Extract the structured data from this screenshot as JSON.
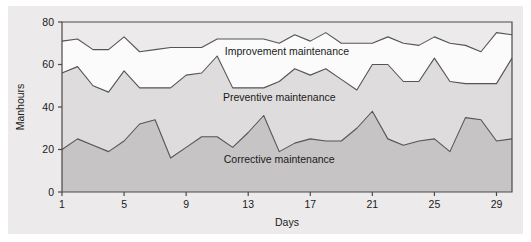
{
  "chart_data": {
    "type": "area",
    "stacked": true,
    "title": "",
    "xlabel": "Days",
    "ylabel": "Manhours",
    "xlim": [
      1,
      30
    ],
    "ylim": [
      0,
      80
    ],
    "xticks": [
      1,
      5,
      9,
      13,
      17,
      21,
      25,
      29
    ],
    "xtick_labels": [
      "1",
      "5",
      "9",
      "13",
      "17",
      "21",
      "25",
      "29"
    ],
    "yticks": [
      0,
      20,
      40,
      60,
      80
    ],
    "ytick_labels": [
      "0",
      "20",
      "40",
      "60",
      "80"
    ],
    "grid": false,
    "legend_position": "inline-annotations",
    "x": [
      1,
      2,
      3,
      4,
      5,
      6,
      7,
      8,
      9,
      10,
      11,
      12,
      13,
      14,
      15,
      16,
      17,
      18,
      19,
      20,
      21,
      22,
      23,
      24,
      25,
      26,
      27,
      28,
      29,
      30
    ],
    "series": [
      {
        "name": "Corrective maintenance",
        "label": "Corrective maintenance",
        "fill_color": "#c6c4c4",
        "line_color": "#555555",
        "values": [
          20,
          25,
          22,
          19,
          24,
          32,
          34,
          16,
          21,
          26,
          26,
          21,
          28,
          36,
          19,
          23,
          25,
          24,
          24,
          30,
          38,
          25,
          22,
          24,
          25,
          19,
          35,
          34,
          24,
          25
        ]
      },
      {
        "name": "Preventive maintenance",
        "label": "Preventive maintenance",
        "fill_color": "#dedcdc",
        "line_color": "#555555",
        "values": [
          36,
          34,
          28,
          28,
          33,
          17,
          15,
          33,
          34,
          30,
          38,
          28,
          21,
          13,
          33,
          35,
          30,
          34,
          29,
          18,
          22,
          35,
          30,
          28,
          38,
          33,
          16,
          17,
          27,
          38
        ]
      },
      {
        "name": "Improvement maintenance",
        "label": "Improvement maintenance",
        "fill_color": "#fbfbfb",
        "line_color": "#555555",
        "values": [
          15,
          13,
          17,
          20,
          16,
          17,
          18,
          19,
          13,
          12,
          8,
          23,
          23,
          23,
          18,
          16,
          16,
          17,
          17,
          22,
          10,
          13,
          18,
          17,
          10,
          18,
          18,
          15,
          24,
          11
        ]
      }
    ],
    "cumulative": {
      "corrective": [
        20,
        25,
        22,
        19,
        24,
        32,
        34,
        16,
        21,
        26,
        26,
        21,
        28,
        36,
        19,
        23,
        25,
        24,
        24,
        30,
        38,
        25,
        22,
        24,
        25,
        19,
        35,
        34,
        24,
        25
      ],
      "preventive_top": [
        56,
        59,
        50,
        47,
        57,
        49,
        49,
        49,
        55,
        56,
        64,
        49,
        49,
        49,
        52,
        58,
        55,
        58,
        53,
        48,
        60,
        60,
        52,
        52,
        63,
        52,
        51,
        51,
        51,
        63
      ],
      "improvement_top": [
        71,
        72,
        67,
        67,
        73,
        66,
        67,
        68,
        68,
        68,
        72,
        72,
        72,
        72,
        70,
        74,
        71,
        75,
        70,
        70,
        70,
        73,
        70,
        69,
        73,
        70,
        69,
        66,
        75,
        74
      ]
    },
    "annotations": [
      {
        "text": "Improvement maintenance",
        "x_day": 15.5,
        "y_value": 64.5
      },
      {
        "text": "Preventive maintenance",
        "x_day": 15.0,
        "y_value": 43.0
      },
      {
        "text": "Corrective maintenance",
        "x_day": 15.0,
        "y_value": 13.5
      }
    ]
  },
  "axes": {
    "x_title": "Days",
    "y_title": "Manhours"
  },
  "colors": {
    "panel_background": "#eceaea",
    "axis_line": "#4a4a4a",
    "corrective_fill": "#c6c4c4",
    "preventive_fill": "#dedcdc",
    "improvement_fill": "#fbfbfb",
    "series_line": "#555555",
    "text": "#1a1a1a"
  }
}
